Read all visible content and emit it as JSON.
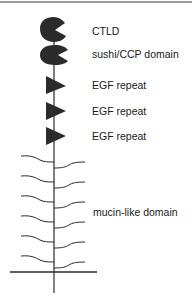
{
  "diagram": {
    "type": "protein-domain-schematic",
    "colors": {
      "domain_fill": "#2b2b2b",
      "line": "#2b2b2b",
      "text": "#1a1a1a",
      "border": "#9a9a9a"
    },
    "labels": [
      {
        "id": "ctld",
        "text": "CTLD",
        "x": 92,
        "y": 25
      },
      {
        "id": "sushi",
        "text": "sushi/CCP domain",
        "x": 92,
        "y": 48
      },
      {
        "id": "egf1",
        "text": "EGF repeat",
        "x": 92,
        "y": 79
      },
      {
        "id": "egf2",
        "text": "EGF repeat",
        "x": 92,
        "y": 105
      },
      {
        "id": "egf3",
        "text": "EGF repeat",
        "x": 92,
        "y": 130
      },
      {
        "id": "mucin",
        "text": "mucin-like domain",
        "x": 93,
        "y": 206
      }
    ]
  }
}
